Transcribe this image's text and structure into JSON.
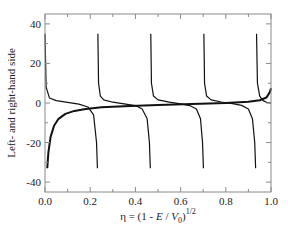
{
  "chart_data": {
    "type": "line",
    "title": "",
    "xlabel": "η = (1 - E / V0)^1/2",
    "xlabel_parts": {
      "main": "η = (1 - ",
      "E": "E",
      "slash": " / ",
      "V": "V",
      "sub": "0",
      "close": ")",
      "sup": "1/2"
    },
    "ylabel": "Left- and right-hand side",
    "xlim": [
      0.0,
      1.0
    ],
    "ylim": [
      -45,
      45
    ],
    "x_ticks": [
      0.0,
      0.2,
      0.4,
      0.6,
      0.8,
      1.0
    ],
    "x_tick_labels": [
      "0.0",
      "0.2",
      "0.4",
      "0.6",
      "0.8",
      "1.0"
    ],
    "x_minor_ticks": [
      0.1,
      0.3,
      0.5,
      0.7,
      0.9
    ],
    "y_ticks": [
      -40,
      -20,
      0,
      20,
      40
    ],
    "y_tick_labels": [
      "-40",
      "-20",
      "0",
      "20",
      "40"
    ],
    "y_minor_ticks": [
      -30,
      -10,
      10,
      30
    ],
    "grid": false,
    "legend": null,
    "series": [
      {
        "name": "Left-hand side (tan-like branches)",
        "style": "thin",
        "branches": [
          {
            "x": [
              0.0,
              0.005,
              0.02,
              0.05,
              0.1,
              0.15,
              0.19,
              0.215,
              0.228,
              0.232
            ],
            "y": [
              35,
              8,
              2.5,
              1.2,
              0.3,
              -0.6,
              -2.0,
              -6,
              -20,
              -33
            ]
          },
          {
            "x": [
              0.234,
              0.237,
              0.245,
              0.26,
              0.3,
              0.35,
              0.4,
              0.43,
              0.452,
              0.462,
              0.466
            ],
            "y": [
              35,
              10,
              3.5,
              1.6,
              0.4,
              -0.4,
              -1.3,
              -3,
              -8,
              -20,
              -33
            ]
          },
          {
            "x": [
              0.468,
              0.471,
              0.48,
              0.5,
              0.55,
              0.6,
              0.64,
              0.67,
              0.688,
              0.697,
              0.701
            ],
            "y": [
              35,
              10,
              3.5,
              1.6,
              0.4,
              -0.4,
              -1.3,
              -3,
              -8,
              -20,
              -33
            ]
          },
          {
            "x": [
              0.703,
              0.706,
              0.715,
              0.735,
              0.78,
              0.83,
              0.87,
              0.9,
              0.918,
              0.928,
              0.932
            ],
            "y": [
              35,
              10,
              3.5,
              1.6,
              0.5,
              -0.3,
              -1.2,
              -3,
              -8,
              -20,
              -33
            ]
          },
          {
            "x": [
              0.936,
              0.94,
              0.95,
              0.965,
              0.98,
              0.995,
              1.0
            ],
            "y": [
              35,
              10,
              3.5,
              1.2,
              0.4,
              0.0,
              -0.2
            ]
          }
        ]
      },
      {
        "name": "Right-hand side",
        "style": "thick",
        "x": [
          0.01,
          0.015,
          0.025,
          0.04,
          0.06,
          0.09,
          0.13,
          0.18,
          0.25,
          0.35,
          0.5,
          0.65,
          0.8,
          0.9,
          0.95,
          0.98,
          0.995,
          1.0
        ],
        "y": [
          -33,
          -25,
          -17,
          -11.5,
          -8,
          -5.5,
          -4,
          -3,
          -2.2,
          -1.6,
          -1.0,
          -0.5,
          0.0,
          0.6,
          1.4,
          2.8,
          5.5,
          7.5
        ]
      }
    ]
  },
  "figure": {
    "ylabel": "Left- and right-hand side"
  }
}
